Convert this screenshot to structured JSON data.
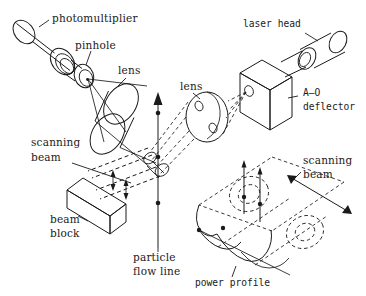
{
  "figure": {
    "kind": "optical-schematic",
    "width": 366,
    "height": 296,
    "background_color": "#ffffff",
    "ink_color": "#1a1a1a"
  },
  "labels": {
    "photomultiplier": "photomultiplier",
    "pinhole": "pinhole",
    "lens_collection": "lens",
    "lens_focusing": "lens",
    "laser_head": "laser head",
    "ao_deflector_line1": "A–O",
    "ao_deflector_line2": "deflector",
    "scanning_left_line1": "scanning",
    "scanning_left_line2": "beam",
    "beam_block_line1": "beam",
    "beam_block_line2": "block",
    "particle_flow_line1": "particle",
    "particle_flow_line2": "flow line",
    "scanning_right_line1": "scanning",
    "scanning_right_line2": "beam",
    "power_profile": "power profile"
  },
  "components": [
    {
      "name": "photomultiplier",
      "label": "photomultiplier"
    },
    {
      "name": "pinhole",
      "label": "pinhole"
    },
    {
      "name": "collection-lens",
      "label": "lens"
    },
    {
      "name": "focusing-lens",
      "label": "lens"
    },
    {
      "name": "laser-head",
      "label": "laser head"
    },
    {
      "name": "ao-deflector",
      "label": "A–O deflector"
    },
    {
      "name": "beam-block",
      "label": "beam block"
    },
    {
      "name": "scanning-beam",
      "label": "scanning beam"
    },
    {
      "name": "particle-flow-line",
      "label": "particle flow line"
    },
    {
      "name": "power-profile",
      "label": "power profile"
    }
  ]
}
